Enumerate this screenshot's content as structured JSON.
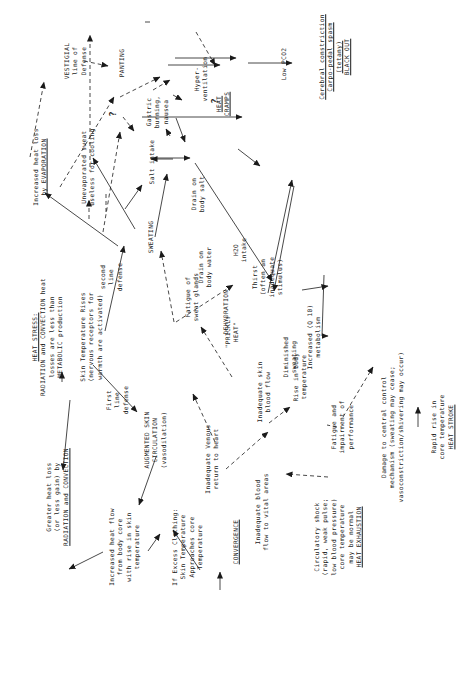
{
  "diagram": {
    "orientation": "rotated 90 degrees counter-clockwise",
    "nodes": {
      "heat_stress": {
        "lines": [
          "HEAT STRESS:",
          "RADIATION and CONVECTION heat",
          "losses are less than",
          "METABOLIC production"
        ]
      },
      "skin_temp_rises": {
        "lines": [
          "Skin Temperature Rises",
          "(nervous receptors for",
          "warmth are activated)"
        ]
      },
      "greater_heat_loss": {
        "lines": [
          "Greater heat loss",
          "(or less gain) by",
          "RADIATION and CONVECTION"
        ]
      },
      "augmented_skin": {
        "lines": [
          "AUGMENTED SKIN",
          "CIRCULATION",
          "(vasodilation)"
        ]
      },
      "first_line": {
        "lines": [
          "First",
          "line",
          "defense"
        ]
      },
      "increased_heat_flow": {
        "lines": [
          "Increased heat flow",
          "from body core",
          "with rise in skin",
          "temperature"
        ]
      },
      "excess_clothing": {
        "lines": [
          "If Excess Clothing:",
          "Skin Temperature",
          "Approaches core",
          "Temperature"
        ]
      },
      "convergence": {
        "lines": [
          "CONVERGENCE"
        ]
      },
      "inadequate_venous": {
        "lines": [
          "Inadequate Venous",
          "return to heart"
        ]
      },
      "inadequate_blood": {
        "lines": [
          "Inadequate blood",
          "flow to vital areas"
        ]
      },
      "circulatory_shock": {
        "lines": [
          "Circulatory shock",
          "(rapid, weak pulse;",
          "low blood pressure)",
          "core temperature",
          "may be normal",
          "HEAT EXHAUSTION"
        ]
      },
      "inadequate_skin": {
        "lines": [
          "Inadequate skin",
          "blood flow"
        ]
      },
      "prickly_heat": {
        "lines": [
          "\"PRICKLY",
          "HEAT\""
        ]
      },
      "second_line": {
        "lines": [
          "second",
          "line",
          "defense"
        ]
      },
      "sweating": {
        "lines": [
          "SWEATING"
        ]
      },
      "increased_evap": {
        "lines": [
          "Increased heat loss",
          "by EVAPORATION"
        ]
      },
      "unevaporated": {
        "lines": [
          "Unevaporated sweat",
          "useless for cooling"
        ]
      },
      "vestigial": {
        "lines": [
          "VESTIGIAL",
          "line of",
          "Defense"
        ]
      },
      "panting": {
        "lines": [
          "PANTING"
        ]
      },
      "hyperventilation": {
        "lines": [
          "Hyper-",
          "ventilation"
        ]
      },
      "low_pco2": {
        "lines": [
          "Low PCO2"
        ]
      },
      "cerebral": {
        "lines": [
          "Cerebral constriction",
          "Carpo-pedal spasm",
          "(tetany)",
          "BLACK OUT"
        ]
      },
      "salt_intake": {
        "lines": [
          "Salt intake"
        ]
      },
      "gastric": {
        "lines": [
          "Gastric",
          "burning,",
          "nausea"
        ]
      },
      "drain_salt": {
        "lines": [
          "Drain on",
          "body salt"
        ]
      },
      "heat_cramps": {
        "lines": [
          "HEAT",
          "CRAMPS"
        ]
      },
      "drain_water": {
        "lines": [
          "Drain on",
          "body water"
        ]
      },
      "h2o_intake": {
        "lines": [
          "H2O",
          "intake"
        ]
      },
      "thirst": {
        "lines": [
          "Thirst",
          "(often an",
          "inadequate",
          "stimulus)"
        ]
      },
      "dehydration": {
        "lines": [
          "DEHYDRATION"
        ]
      },
      "fatigue_sweat": {
        "lines": [
          "Fatigue of",
          "sweat glands"
        ]
      },
      "diminished_sweating": {
        "lines": [
          "Diminished",
          "sweating"
        ]
      },
      "rise_body_temp": {
        "lines": [
          "Rise in body",
          "temperature"
        ]
      },
      "increased_metabolism": {
        "lines": [
          "Increased (Q 10)",
          "metabolism"
        ]
      },
      "fatigue_perf": {
        "lines": [
          "Fatigue and",
          "impairment of",
          "performance"
        ]
      },
      "damage_central": {
        "lines": [
          "Damage to central control",
          "mechanism (sweating may cease;",
          "vasoconstriction/shivering may occur)"
        ]
      },
      "rapid_rise": {
        "lines": [
          "Rapid rise in",
          "core temperature",
          "HEAT STROKE"
        ]
      }
    },
    "annotations": {
      "question_mark_1": "?",
      "question_mark_2": "?"
    }
  }
}
